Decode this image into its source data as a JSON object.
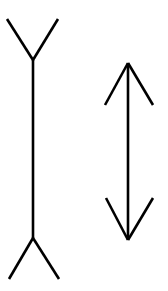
{
  "diagram": {
    "title": "",
    "background": "#ffffff",
    "stroke_color": "#000000",
    "figures": [
      {
        "name": "outward-fins-line",
        "shaft": {
          "x1": 33,
          "y1": 60,
          "x2": 33,
          "y2": 238
        },
        "fins": [
          {
            "x1": 7,
            "y1": 19,
            "x2": 33,
            "y2": 60
          },
          {
            "x1": 58,
            "y1": 19,
            "x2": 33,
            "y2": 60
          },
          {
            "x1": 33,
            "y1": 238,
            "x2": 9,
            "y2": 279
          },
          {
            "x1": 33,
            "y1": 238,
            "x2": 59,
            "y2": 279
          }
        ]
      },
      {
        "name": "inward-arrowheads-line",
        "shaft": {
          "x1": 128,
          "y1": 63,
          "x2": 128,
          "y2": 240
        },
        "fins": [
          {
            "x1": 128,
            "y1": 63,
            "x2": 105,
            "y2": 105
          },
          {
            "x1": 128,
            "y1": 63,
            "x2": 153,
            "y2": 105
          },
          {
            "x1": 106,
            "y1": 198,
            "x2": 128,
            "y2": 240
          },
          {
            "x1": 153,
            "y1": 198,
            "x2": 128,
            "y2": 240
          }
        ]
      }
    ]
  }
}
